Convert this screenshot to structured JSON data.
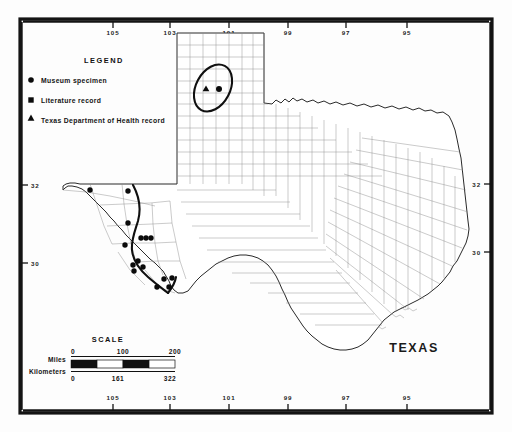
{
  "figure": {
    "kind": "distribution-map",
    "state_label": "TEXAS",
    "frame": {
      "stroke_color": "#141414"
    }
  },
  "legend": {
    "title": "LEGEND",
    "items": [
      {
        "symbol": "circle",
        "label": "Museum specimen"
      },
      {
        "symbol": "square",
        "label": "Literature record"
      },
      {
        "symbol": "triangle",
        "label": "Texas Department of Health record"
      }
    ]
  },
  "scale": {
    "title": "SCALE",
    "rows": [
      {
        "unit": "Miles",
        "ticks": [
          "0",
          "100",
          "200"
        ]
      },
      {
        "unit": "Kilometers",
        "ticks": [
          "0",
          "161",
          "322"
        ]
      }
    ]
  },
  "axes": {
    "longitude_top": [
      "105",
      "103",
      "101",
      "99",
      "97",
      "95"
    ],
    "longitude_bottom": [
      "105",
      "103",
      "101",
      "99",
      "97",
      "95"
    ],
    "latitude_left": [
      "32",
      "30"
    ],
    "latitude_right": [
      "32",
      "30"
    ]
  },
  "colors": {
    "ink": "#111111",
    "county_line": "#8a8a8a",
    "state_outline": "#2a2a2a",
    "land_fill": "#ffffff"
  },
  "records": {
    "museum_specimen_count": 16,
    "health_record_count": 1,
    "literature_record_count": 0
  }
}
